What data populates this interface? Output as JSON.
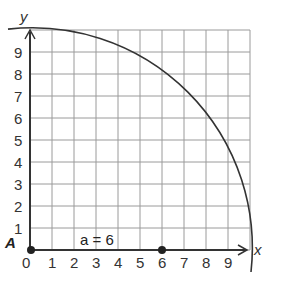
{
  "diagram": {
    "axes": {
      "x_label": "x",
      "y_label": "y",
      "x_ticks": [
        "0",
        "1",
        "2",
        "3",
        "4",
        "5",
        "6",
        "7",
        "8",
        "9"
      ],
      "y_ticks": [
        "1",
        "2",
        "3",
        "4",
        "5",
        "6",
        "7",
        "8",
        "9"
      ],
      "range": [
        0,
        10
      ]
    },
    "curve": {
      "type": "quarter-circle",
      "center": [
        0,
        0
      ],
      "radius": 10
    },
    "points": [
      {
        "label": "A",
        "x": 0,
        "y": 0
      },
      {
        "label": "",
        "x": 6,
        "y": 0
      }
    ],
    "annotation": "a = 6",
    "colors": {
      "grid": "#9a9a9a",
      "axis": "#333333",
      "curve": "#333333",
      "point": "#222222"
    }
  }
}
